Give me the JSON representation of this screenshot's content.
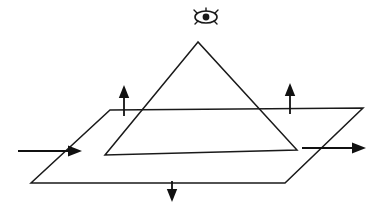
{
  "figure": {
    "background_color": "#ffffff",
    "stroke_color": "#1a1a1a",
    "canvas": {
      "width": 383,
      "height": 212
    }
  },
  "shapes": {
    "pyramid": {
      "name": "triangle-pyramid",
      "apex": {
        "x": 198,
        "y": 42
      },
      "base_left": {
        "x": 105,
        "y": 155
      },
      "base_right": {
        "x": 297,
        "y": 150
      },
      "points": "198,42 105,155 297,150"
    },
    "base_plane": {
      "name": "parallelogram-base-plane",
      "top_left": {
        "x": 110,
        "y": 110
      },
      "top_right": {
        "x": 363,
        "y": 108
      },
      "bottom_right": {
        "x": 285,
        "y": 183
      },
      "bottom_left": {
        "x": 31,
        "y": 183
      },
      "points": "110,110 363,108 285,183 31,183"
    }
  },
  "arrows": {
    "left_horizontal": {
      "name": "arrow-left-horizontal-right",
      "direction": "right",
      "from": {
        "x": 18,
        "y": 151
      },
      "to": {
        "x": 82,
        "y": 151
      }
    },
    "right_horizontal": {
      "name": "arrow-right-horizontal-right",
      "direction": "right",
      "from": {
        "x": 302,
        "y": 148
      },
      "to": {
        "x": 366,
        "y": 148
      }
    },
    "left_up": {
      "name": "arrow-left-up",
      "direction": "up",
      "from": {
        "x": 124,
        "y": 116
      },
      "to": {
        "x": 124,
        "y": 85
      }
    },
    "right_up": {
      "name": "arrow-right-up",
      "direction": "up",
      "from": {
        "x": 290,
        "y": 114
      },
      "to": {
        "x": 290,
        "y": 83
      }
    },
    "center_down": {
      "name": "arrow-center-down",
      "direction": "down",
      "from": {
        "x": 172,
        "y": 181
      },
      "to": {
        "x": 172,
        "y": 202
      }
    }
  },
  "eye": {
    "name": "eye-icon",
    "center": {
      "x": 206,
      "y": 17
    },
    "radius_x": 11,
    "radius_y": 6,
    "pupil_radius": 3.4,
    "label": "observer-eye"
  }
}
